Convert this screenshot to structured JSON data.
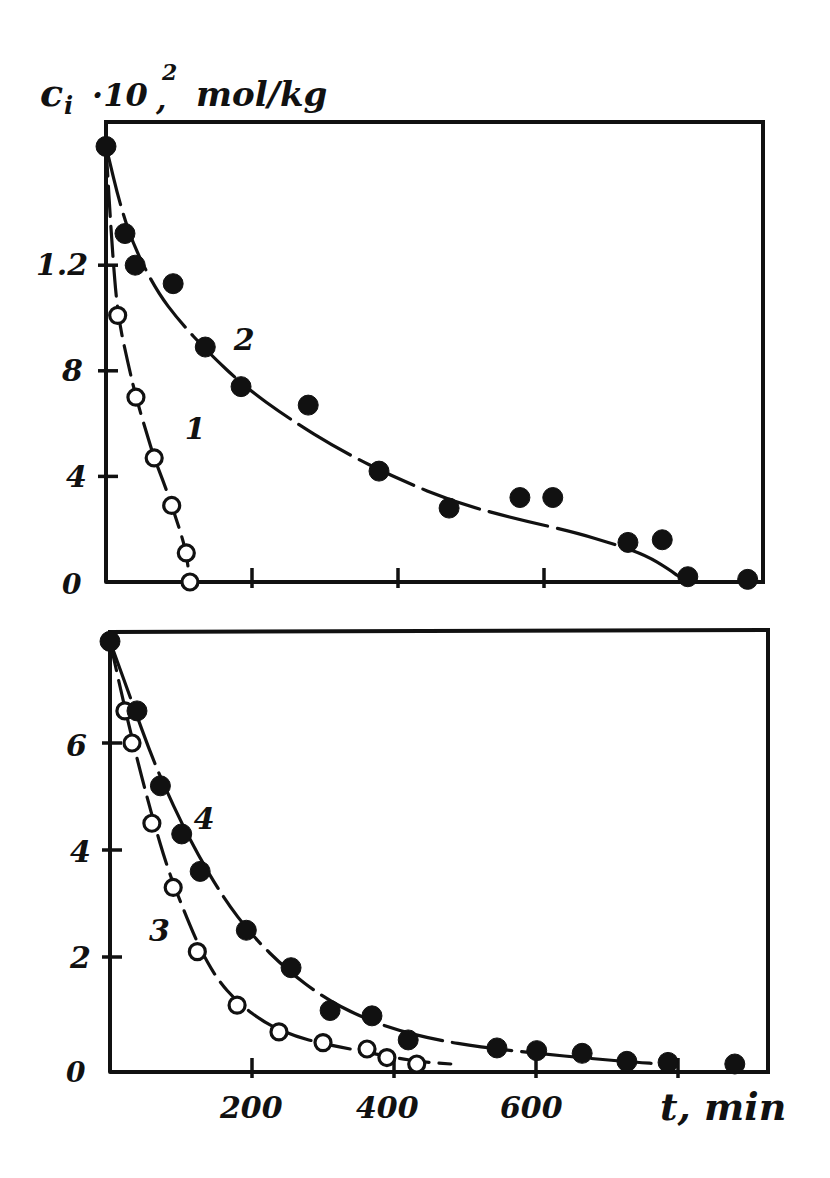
{
  "page": {
    "corner_mark": ""
  },
  "chart_data": [
    {
      "type": "scatter",
      "panel": "upper",
      "title": "",
      "ylabel": "c_i·10², mol/kg",
      "ylabel_parts": {
        "base": "c",
        "sub": "i",
        "mid": " ·10",
        "sup": "2",
        "tail": ", mol/kg"
      },
      "xlabel": "",
      "xlim": [
        0,
        900
      ],
      "ylim": [
        0,
        17.4
      ],
      "x_ticks": [
        200,
        400,
        600
      ],
      "x_tick_labels": [
        "",
        "",
        ""
      ],
      "y_ticks": [
        0,
        4,
        8,
        12
      ],
      "y_tick_labels": [
        "0",
        "4",
        "8",
        "1.2"
      ],
      "grid": false,
      "legend": "inline curve numbers",
      "series": [
        {
          "name": "1",
          "marker": "open",
          "label_pos": {
            "t": 108,
            "c": 5.4
          },
          "points": [
            {
              "t": 0,
              "c": 16.5
            },
            {
              "t": 16,
              "c": 10.1
            },
            {
              "t": 41,
              "c": 7.0
            },
            {
              "t": 66,
              "c": 4.7
            },
            {
              "t": 90,
              "c": 2.9
            },
            {
              "t": 110,
              "c": 1.1
            },
            {
              "t": 115,
              "c": 0.0
            }
          ],
          "fit": [
            [
              0,
              16.5
            ],
            [
              8,
              12.8
            ],
            [
              16,
              10.1
            ],
            [
              30,
              8.3
            ],
            [
              41,
              7.0
            ],
            [
              55,
              5.7
            ],
            [
              66,
              4.7
            ],
            [
              80,
              3.7
            ],
            [
              90,
              2.9
            ],
            [
              102,
              1.9
            ],
            [
              110,
              1.1
            ],
            [
              115,
              0.0
            ]
          ]
        },
        {
          "name": "2",
          "marker": "filled",
          "label_pos": {
            "t": 175,
            "c": 8.8
          },
          "points": [
            {
              "t": 0,
              "c": 16.5
            },
            {
              "t": 26,
              "c": 13.2
            },
            {
              "t": 40,
              "c": 12.0
            },
            {
              "t": 92,
              "c": 11.3
            },
            {
              "t": 136,
              "c": 8.9
            },
            {
              "t": 185,
              "c": 7.4
            },
            {
              "t": 277,
              "c": 6.7
            },
            {
              "t": 374,
              "c": 4.2
            },
            {
              "t": 470,
              "c": 2.8
            },
            {
              "t": 567,
              "c": 3.2
            },
            {
              "t": 612,
              "c": 3.2
            },
            {
              "t": 715,
              "c": 1.5
            },
            {
              "t": 762,
              "c": 1.6
            },
            {
              "t": 797,
              "c": 0.2
            },
            {
              "t": 879,
              "c": 0.1
            }
          ],
          "fit": [
            [
              0,
              16.5
            ],
            [
              20,
              14.2
            ],
            [
              40,
              12.6
            ],
            [
              70,
              11.0
            ],
            [
              100,
              9.9
            ],
            [
              140,
              8.7
            ],
            [
              190,
              7.4
            ],
            [
              250,
              6.2
            ],
            [
              320,
              5.0
            ],
            [
              400,
              3.9
            ],
            [
              480,
              3.0
            ],
            [
              560,
              2.4
            ],
            [
              640,
              1.9
            ],
            [
              700,
              1.4
            ],
            [
              740,
              1.0
            ],
            [
              770,
              0.5
            ],
            [
              790,
              0.1
            ],
            [
              800,
              0.0
            ],
            [
              830,
              0.0
            ]
          ]
        }
      ]
    },
    {
      "type": "scatter",
      "panel": "lower",
      "title": "",
      "ylabel": "",
      "xlabel": "t, min",
      "xlim": [
        0,
        930
      ],
      "ylim": [
        0,
        8.0
      ],
      "x_ticks": [
        200,
        400,
        600,
        800
      ],
      "x_tick_labels": [
        "200",
        "400",
        "600",
        ""
      ],
      "y_ticks": [
        0,
        2,
        4,
        6
      ],
      "y_tick_labels": [
        "0",
        "2",
        "4",
        "6"
      ],
      "grid": false,
      "legend": "inline curve numbers",
      "series": [
        {
          "name": "3",
          "marker": "open",
          "label_pos": {
            "t": 55,
            "c": 2.3
          },
          "points": [
            {
              "t": 0,
              "c": 7.9
            },
            {
              "t": 21,
              "c": 6.6
            },
            {
              "t": 31,
              "c": 6.0
            },
            {
              "t": 59,
              "c": 4.5
            },
            {
              "t": 89,
              "c": 3.3
            },
            {
              "t": 123,
              "c": 2.1
            },
            {
              "t": 179,
              "c": 1.1
            },
            {
              "t": 238,
              "c": 0.6
            },
            {
              "t": 300,
              "c": 0.4
            },
            {
              "t": 362,
              "c": 0.28
            },
            {
              "t": 390,
              "c": 0.12
            },
            {
              "t": 432,
              "c": 0.0
            }
          ],
          "fit": [
            [
              0,
              7.9
            ],
            [
              20,
              6.7
            ],
            [
              40,
              5.6
            ],
            [
              60,
              4.6
            ],
            [
              80,
              3.7
            ],
            [
              100,
              3.0
            ],
            [
              125,
              2.2
            ],
            [
              150,
              1.6
            ],
            [
              180,
              1.15
            ],
            [
              220,
              0.75
            ],
            [
              260,
              0.52
            ],
            [
              300,
              0.38
            ],
            [
              350,
              0.25
            ],
            [
              400,
              0.12
            ],
            [
              440,
              0.04
            ],
            [
              480,
              0.0
            ]
          ]
        },
        {
          "name": "4",
          "marker": "filled",
          "label_pos": {
            "t": 118,
            "c": 4.4
          },
          "points": [
            {
              "t": 0,
              "c": 7.9
            },
            {
              "t": 38,
              "c": 6.6
            },
            {
              "t": 71,
              "c": 5.2
            },
            {
              "t": 101,
              "c": 4.3
            },
            {
              "t": 127,
              "c": 3.6
            },
            {
              "t": 192,
              "c": 2.5
            },
            {
              "t": 255,
              "c": 1.8
            },
            {
              "t": 310,
              "c": 1.0
            },
            {
              "t": 369,
              "c": 0.9
            },
            {
              "t": 420,
              "c": 0.45
            },
            {
              "t": 545,
              "c": 0.3
            },
            {
              "t": 601,
              "c": 0.25
            },
            {
              "t": 665,
              "c": 0.2
            },
            {
              "t": 728,
              "c": 0.05
            },
            {
              "t": 786,
              "c": 0.03
            },
            {
              "t": 880,
              "c": 0.0
            }
          ],
          "fit": [
            [
              0,
              7.9
            ],
            [
              30,
              6.8
            ],
            [
              60,
              5.7
            ],
            [
              90,
              4.8
            ],
            [
              120,
              4.0
            ],
            [
              160,
              3.1
            ],
            [
              200,
              2.4
            ],
            [
              250,
              1.75
            ],
            [
              300,
              1.25
            ],
            [
              350,
              0.9
            ],
            [
              400,
              0.65
            ],
            [
              460,
              0.45
            ],
            [
              520,
              0.32
            ],
            [
              600,
              0.2
            ],
            [
              680,
              0.1
            ],
            [
              740,
              0.03
            ],
            [
              780,
              0.0
            ]
          ]
        }
      ]
    }
  ],
  "labels": {
    "ylabel_c": "c",
    "ylabel_i": "i",
    "ylabel_mid": "·10",
    "ylabel_sup": "2",
    "ylabel_comma": ",",
    "ylabel_units": "mol/kg",
    "xlabel": "t, min",
    "upper_y_ticks": [
      "0",
      "4",
      "8",
      "1.2"
    ],
    "lower_y_ticks": [
      "0",
      "2",
      "4",
      "6"
    ],
    "lower_x_ticks": [
      "200",
      "400",
      "600"
    ],
    "curve_1": "1",
    "curve_2": "2",
    "curve_3": "3",
    "curve_4": "4"
  }
}
